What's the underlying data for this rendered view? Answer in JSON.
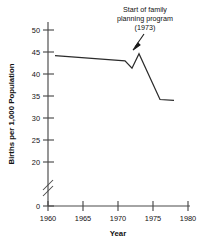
{
  "chart_data": {
    "type": "line",
    "title": "",
    "subtitle": "",
    "xlabel": "Year",
    "ylabel": "Births per 1,000 Population",
    "xlim": [
      1960,
      1980
    ],
    "ylim": [
      0,
      50
    ],
    "y_axis_break": {
      "present": true,
      "between": [
        0,
        20
      ],
      "symbol": "double-slash"
    },
    "grid": false,
    "legend": null,
    "xticks": [
      1960,
      1965,
      1970,
      1975,
      1980
    ],
    "xtick_labels": [
      "1960",
      "1965",
      "1970",
      "1975",
      "1980"
    ],
    "yticks": [
      0,
      20,
      25,
      30,
      35,
      40,
      45,
      50
    ],
    "ytick_labels": [
      "0",
      "20",
      "25",
      "30",
      "35",
      "40",
      "45",
      "50"
    ],
    "series": [
      {
        "name": "Births per 1,000 Population",
        "x": [
          1961,
          1971,
          1972,
          1973,
          1976,
          1978
        ],
        "values": [
          44.2,
          43.0,
          41.3,
          44.6,
          34.2,
          34.0
        ]
      }
    ],
    "annotations": [
      {
        "text_lines": [
          "Start of family",
          "planning program",
          "(1973)"
        ],
        "text": "Start of family planning program (1973)",
        "points_to_x": 1973,
        "points_to_y": 44.6,
        "arrow": true
      }
    ],
    "colors": {
      "line": "#2b2b2b",
      "axis": "#4a4a4a",
      "text": "#111111",
      "background": "#ffffff"
    }
  },
  "axes": {
    "x_title": "Year",
    "y_title": "Births per 1,000 Population"
  }
}
